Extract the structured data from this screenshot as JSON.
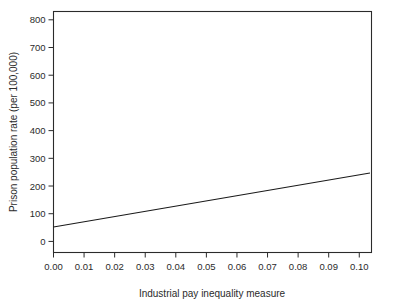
{
  "chart_data": {
    "type": "scatter",
    "title": "",
    "xlabel": "Industrial pay inequality measure",
    "ylabel": "Prison population rate (per 100,000)",
    "xlim": [
      0.0,
      0.104
    ],
    "ylim": [
      -40,
      830
    ],
    "grid": false,
    "legend": null,
    "xticks": [
      0.0,
      0.01,
      0.02,
      0.03,
      0.04,
      0.05,
      0.06,
      0.07,
      0.08,
      0.09,
      0.1
    ],
    "xtick_labels": [
      "0.00",
      "0.01",
      "0.02",
      "0.03",
      "0.04",
      "0.05",
      "0.06",
      "0.07",
      "0.08",
      "0.09",
      "0.10"
    ],
    "yticks": [
      0,
      100,
      200,
      300,
      400,
      500,
      600,
      700,
      800
    ],
    "ytick_labels": [
      "0",
      "100",
      "200",
      "300",
      "400",
      "500",
      "600",
      "700",
      "800"
    ],
    "points": [
      {
        "x": 0.008,
        "y": 62
      },
      {
        "x": 0.0085,
        "y": 55
      },
      {
        "x": 0.0098,
        "y": 95
      },
      {
        "x": 0.0138,
        "y": 113
      },
      {
        "x": 0.0142,
        "y": 75
      },
      {
        "x": 0.014,
        "y": 68
      },
      {
        "x": 0.0145,
        "y": 36
      },
      {
        "x": 0.0152,
        "y": 97
      },
      {
        "x": 0.0155,
        "y": 88
      },
      {
        "x": 0.0158,
        "y": 84
      },
      {
        "x": 0.0162,
        "y": 167
      },
      {
        "x": 0.0168,
        "y": 90
      },
      {
        "x": 0.0198,
        "y": 124
      },
      {
        "x": 0.0205,
        "y": 99
      },
      {
        "x": 0.0228,
        "y": 56
      },
      {
        "x": 0.0265,
        "y": 86
      },
      {
        "x": 0.0268,
        "y": 80
      },
      {
        "x": 0.0288,
        "y": 112
      },
      {
        "x": 0.032,
        "y": 134
      },
      {
        "x": 0.0425,
        "y": 152
      },
      {
        "x": 0.0428,
        "y": 72
      },
      {
        "x": 0.0448,
        "y": 97
      },
      {
        "x": 0.0462,
        "y": 133
      },
      {
        "x": 0.051,
        "y": 150
      },
      {
        "x": 0.0558,
        "y": 158
      },
      {
        "x": 0.0688,
        "y": 89
      },
      {
        "x": 0.0698,
        "y": 52
      },
      {
        "x": 0.0712,
        "y": 78
      },
      {
        "x": 0.0812,
        "y": 212
      },
      {
        "x": 0.084,
        "y": 697
      },
      {
        "x": 0.094,
        "y": 81
      }
    ],
    "trend_line": {
      "x_start": 0.0,
      "y_start": 52,
      "x_end": 0.1035,
      "y_end": 247
    },
    "annotations": [
      {
        "label": "USA",
        "x": 0.084,
        "y": 697,
        "boxed": true
      }
    ]
  }
}
